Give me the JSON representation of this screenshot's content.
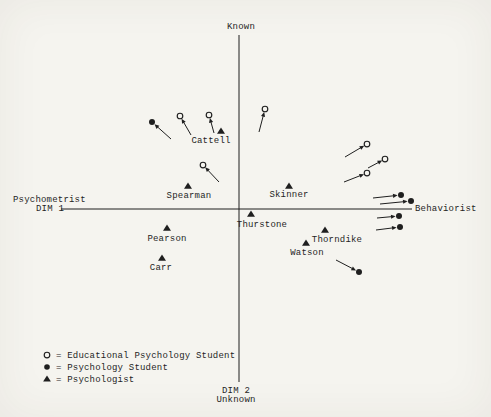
{
  "page": {
    "paper_color": "#f5f4ef",
    "ink_color": "#1f1f1f"
  },
  "chart_data": {
    "type": "scatter",
    "plot_kind": "two-dimensional similarity space with drift vectors (scanned book figure)",
    "origin_px": {
      "x": 239,
      "y": 209
    },
    "axis": {
      "top_label": "Known",
      "bottom_label_line1": "DIM 2",
      "bottom_label_line2": "Unknown",
      "left_label_line1": "Psychometrist",
      "left_label_line2": "DIM 1",
      "right_label": "Behaviorist",
      "vertical_px": {
        "x": 239,
        "y_top": 35,
        "y_bottom": 382
      },
      "horizontal_px": {
        "y": 209,
        "x_left": 61,
        "x_right": 412
      }
    },
    "series": [
      {
        "name": "Educational Psychology Student",
        "marker": "open-circle",
        "points": [
          {
            "dim1": -59,
            "dim2": 93,
            "tail_dim1": -48,
            "tail_dim2": 74
          },
          {
            "dim1": -30,
            "dim2": 94,
            "tail_dim1": -25,
            "tail_dim2": 76
          },
          {
            "dim1": -36,
            "dim2": 44,
            "tail_dim1": -20,
            "tail_dim2": 27
          },
          {
            "dim1": 26,
            "dim2": 100,
            "tail_dim1": 20,
            "tail_dim2": 77
          },
          {
            "dim1": 128,
            "dim2": 65,
            "tail_dim1": 106,
            "tail_dim2": 52
          },
          {
            "dim1": 146,
            "dim2": 50,
            "tail_dim1": 129,
            "tail_dim2": 41
          },
          {
            "dim1": 128,
            "dim2": 36,
            "tail_dim1": 105,
            "tail_dim2": 27
          }
        ]
      },
      {
        "name": "Psychology Student",
        "marker": "filled-circle",
        "points": [
          {
            "dim1": -87,
            "dim2": 87,
            "tail_dim1": -68,
            "tail_dim2": 70
          },
          {
            "dim1": 162,
            "dim2": 14,
            "tail_dim1": 134,
            "tail_dim2": 11
          },
          {
            "dim1": 172,
            "dim2": 8,
            "tail_dim1": 141,
            "tail_dim2": 5
          },
          {
            "dim1": 160,
            "dim2": -7,
            "tail_dim1": 138,
            "tail_dim2": -9
          },
          {
            "dim1": 161,
            "dim2": -18,
            "tail_dim1": 137,
            "tail_dim2": -21
          },
          {
            "dim1": 120,
            "dim2": -63,
            "tail_dim1": 97,
            "tail_dim2": -51
          }
        ]
      },
      {
        "name": "Psychologist",
        "marker": "filled-triangle",
        "points": [
          {
            "label": "Cattell",
            "dim1": -18,
            "dim2": 78,
            "label_dx": -10,
            "label_dy": 8
          },
          {
            "label": "Spearman",
            "dim1": -51,
            "dim2": 23,
            "label_dx": 1,
            "label_dy": 8
          },
          {
            "label": "Skinner",
            "dim1": 50,
            "dim2": 23,
            "label_dx": 0,
            "label_dy": 7
          },
          {
            "label": "Thurstone",
            "dim1": 12,
            "dim2": -5,
            "label_dx": 11,
            "label_dy": 9
          },
          {
            "label": "Pearson",
            "dim1": -72,
            "dim2": -19,
            "label_dx": 0,
            "label_dy": 9
          },
          {
            "label": "Carr",
            "dim1": -77,
            "dim2": -49,
            "label_dx": -1,
            "label_dy": 8
          },
          {
            "label": "Thorndike",
            "dim1": 86,
            "dim2": -21,
            "label_dx": 12,
            "label_dy": 8
          },
          {
            "label": "Watson",
            "dim1": 67,
            "dim2": -34,
            "label_dx": 1,
            "label_dy": 8
          }
        ]
      }
    ],
    "legend": [
      {
        "marker": "open-circle",
        "text": "= Educational Psychology Student"
      },
      {
        "marker": "filled-circle",
        "text": "= Psychology Student"
      },
      {
        "marker": "filled-triangle",
        "text": "= Psychologist"
      }
    ]
  }
}
